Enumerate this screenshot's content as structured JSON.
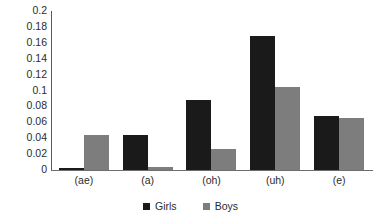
{
  "chart_data": {
    "type": "bar",
    "title": "",
    "subtitle": "",
    "xlabel": "",
    "ylabel": "",
    "categories": [
      "(ae)",
      "(a)",
      "(oh)",
      "(uh)",
      "(e)"
    ],
    "series": [
      {
        "name": "Girls",
        "color": "#1a1a1a",
        "values": [
          0.002,
          0.044,
          0.088,
          0.168,
          0.068
        ]
      },
      {
        "name": "Boys",
        "color": "#7d7d7d",
        "values": [
          0.044,
          0.004,
          0.026,
          0.104,
          0.066
        ]
      }
    ],
    "ylim": [
      0,
      0.2
    ],
    "ytick_step": 0.02,
    "ytick_labels": [
      "0.2",
      "0.18",
      "0.16",
      "0.14",
      "0.12",
      "0.1",
      "0.08",
      "0.06",
      "0.04",
      "0.02",
      "0"
    ],
    "ytick_values": [
      0.2,
      0.18,
      0.16,
      0.14,
      0.12,
      0.1,
      0.08,
      0.06,
      0.04,
      0.02,
      0
    ],
    "grid": false,
    "legend_position": "bottom-center",
    "legend": [
      {
        "label": "Girls",
        "marker": "square",
        "color": "#1a1a1a"
      },
      {
        "label": "Boys",
        "marker": "square",
        "color": "#7d7d7d"
      }
    ]
  }
}
